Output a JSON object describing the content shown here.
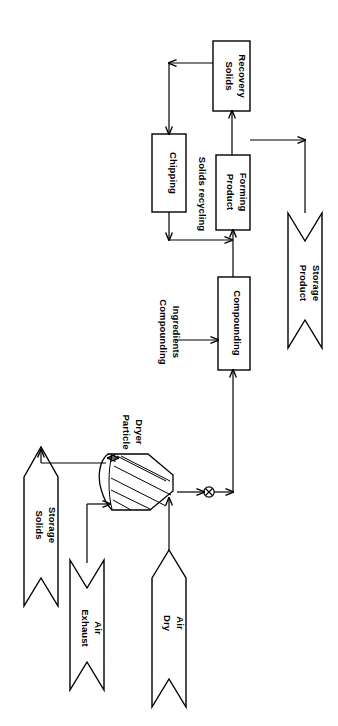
{
  "diagram": {
    "orientation": "rotated-90-ccw",
    "stroke_color": "#000000",
    "background_color": "#ffffff",
    "units": [
      {
        "id": "solids_recovery",
        "label_line1": "Solids",
        "label_line2": "Recovery"
      },
      {
        "id": "chipping",
        "label_line1": "Chipping",
        "label_line2": ""
      },
      {
        "id": "product_forming",
        "label_line1": "Product",
        "label_line2": "Forming"
      },
      {
        "id": "compounding",
        "label_line1": "Compounding",
        "label_line2": ""
      }
    ],
    "equipment": [
      {
        "id": "particle_dryer",
        "label_line1": "Particle",
        "label_line2": "Dryer"
      }
    ],
    "streams": [
      {
        "id": "solids_storage",
        "label_line1": "Solids",
        "label_line2": "Storage"
      },
      {
        "id": "exhaust_air",
        "label_line1": "Exhaust",
        "label_line2": "Air"
      },
      {
        "id": "dry_air",
        "label_line1": "Dry",
        "label_line2": "Air"
      },
      {
        "id": "product_storage",
        "label_line1": "Product",
        "label_line2": "Storage"
      }
    ],
    "stream_labels": [
      {
        "id": "compounding_ingredients",
        "line1": "Compounding",
        "line2": "Ingredients"
      },
      {
        "id": "solids_recycling",
        "line1": "Solids recycling",
        "line2": ""
      }
    ]
  }
}
